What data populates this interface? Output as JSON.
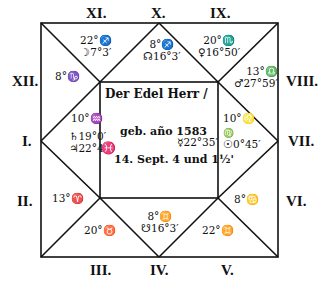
{
  "chart_title": "Horoscope of Der Edel Herr, born 1583",
  "center": {
    "line1": "Der Edel Herr /",
    "line2": "geb. año 1583",
    "line3": "14. Sept. 4 und 1½'"
  },
  "house_labels": {
    "I": "I.",
    "II": "II.",
    "III": "III.",
    "IV": "IV.",
    "V": "V.",
    "VI": "VI.",
    "VII": "VII.",
    "VIII": "VIII.",
    "IX": "IX.",
    "X": "X.",
    "XI": "XI.",
    "XII": "XII."
  },
  "houses": {
    "XI": {
      "cusp": "22°♐",
      "planet": "☽7°3′"
    },
    "X": {
      "cusp": "8°♐",
      "planet": "☊16°3′"
    },
    "IX": {
      "cusp": "20°♏",
      "planet": "♀16°50′"
    },
    "XII": {
      "cusp": "8°♑"
    },
    "VIII": {
      "cusp": "13°♎",
      "planet": "♂27°59′"
    },
    "I": {
      "cusp": "10°♒",
      "planet1": "♄19°0′",
      "planet2": "♃22°43′",
      "side_sign": "♓"
    },
    "VII": {
      "cusp": "10°♌",
      "side_sign": "♍",
      "planet": "☉0°45′"
    },
    "center_right": {
      "planet": "☿22°35′"
    },
    "II": {
      "cusp": "13°♈"
    },
    "VI": {
      "cusp": "8°♋"
    },
    "III": {
      "cusp": "20°♉"
    },
    "IV": {
      "cusp": "8°♊",
      "planet": "☋16°3′"
    },
    "V": {
      "cusp": "22°♊"
    }
  },
  "geometry": {
    "outer": {
      "x1": 41,
      "y1": 23,
      "x2": 278,
      "y2": 257
    },
    "inner": {
      "x1": 100,
      "y1": 82,
      "x2": 218,
      "y2": 198
    }
  },
  "colors": {
    "ink": "#111111",
    "paper": "#ffffff"
  }
}
